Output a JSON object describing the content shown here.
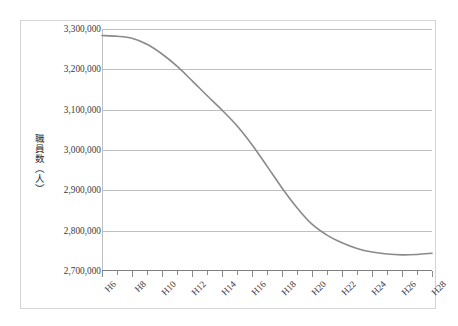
{
  "chart_data": {
    "type": "line",
    "title": "",
    "xlabel": "",
    "ylabel": "職員数（人）",
    "ylim": [
      2700000,
      3300000
    ],
    "ytick_step": 100000,
    "ytick_labels": [
      "3,300,000",
      "3,200,000",
      "3,100,000",
      "3,000,000",
      "2,900,000",
      "2,800,000",
      "2,700,000"
    ],
    "ytick_values": [
      3300000,
      3200000,
      3100000,
      3000000,
      2900000,
      2800000,
      2700000
    ],
    "grid": true,
    "legend": false,
    "legend_position": "none",
    "x": [
      "H6",
      "H7",
      "H8",
      "H9",
      "H10",
      "H11",
      "H12",
      "H13",
      "H14",
      "H15",
      "H16",
      "H17",
      "H18",
      "H19",
      "H20",
      "H21",
      "H22",
      "H23",
      "H24",
      "H25",
      "H26",
      "H27",
      "H28"
    ],
    "xtick_labels": [
      "H6",
      "H8",
      "H10",
      "H12",
      "H14",
      "H16",
      "H18",
      "H20",
      "H22",
      "H24",
      "H26",
      "H28"
    ],
    "series": [
      {
        "name": "職員数",
        "color": "#8a8a8a",
        "values": [
          3284000,
          3282000,
          3277000,
          3262000,
          3238000,
          3208000,
          3172000,
          3135000,
          3099000,
          3060000,
          3013000,
          2960000,
          2906000,
          2857000,
          2816000,
          2789000,
          2770000,
          2756000,
          2747000,
          2742000,
          2740000,
          2741000,
          2744000
        ]
      }
    ]
  }
}
